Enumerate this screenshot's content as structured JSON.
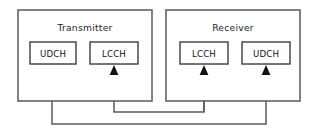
{
  "diagram": {
    "title_visible": false,
    "canvas": {
      "width": 316,
      "height": 133,
      "background": "#ffffff"
    },
    "colors": {
      "outer_border": "#636363",
      "inner_border": "#3d3d3d",
      "connector": "#5a5a5a",
      "arrow_fill": "#111111",
      "text": "#1c1c1c",
      "page_background": "#ffffff"
    },
    "groups": [
      {
        "id": "transmitter",
        "label": "Transmitter",
        "rect": {
          "x": 18,
          "y": 10,
          "width": 134,
          "height": 91
        },
        "label_position": {
          "x": 85,
          "y": 31
        },
        "channels": [
          {
            "id": "tx-udch",
            "label": "UDCH",
            "rect": {
              "x": 30,
              "y": 42,
              "width": 46,
              "height": 22
            },
            "text_position": {
              "x": 53,
              "y": 56
            },
            "role": "source"
          },
          {
            "id": "tx-lcch",
            "label": "LCCH",
            "rect": {
              "x": 90,
              "y": 42,
              "width": 48,
              "height": 22
            },
            "text_position": {
              "x": 114,
              "y": 56
            },
            "role": "destination"
          }
        ]
      },
      {
        "id": "receiver",
        "label": "Receiver",
        "rect": {
          "x": 166,
          "y": 10,
          "width": 134,
          "height": 91
        },
        "label_position": {
          "x": 233,
          "y": 31
        },
        "channels": [
          {
            "id": "rx-lcch",
            "label": "LCCH",
            "rect": {
              "x": 180,
              "y": 42,
              "width": 48,
              "height": 22
            },
            "text_position": {
              "x": 204,
              "y": 56
            },
            "role": "source"
          },
          {
            "id": "rx-udch",
            "label": "UDCH",
            "rect": {
              "x": 242,
              "y": 42,
              "width": 48,
              "height": 22
            },
            "text_position": {
              "x": 266,
              "y": 56
            },
            "role": "destination"
          }
        ]
      }
    ],
    "connections": [
      {
        "id": "udch-link",
        "from": "tx-udch",
        "to": "rx-udch",
        "direction": "transmitter-to-receiver",
        "routing_y": 124,
        "path": "M 52 64 L 52 124 L 266 124 L 266 76",
        "arrow_at": {
          "x": 266,
          "y": 65
        }
      },
      {
        "id": "lcch-link",
        "from": "rx-lcch",
        "to": "tx-lcch",
        "direction": "receiver-to-transmitter",
        "routing_y": 112,
        "path": "M 204 64 L 204 112 L 114 112 L 114 76",
        "arrow_at": {
          "x": 114,
          "y": 65
        }
      },
      {
        "id": "rx-lcch-feed",
        "from": "rx-lcch-internal",
        "to": "rx-lcch",
        "direction": "upward",
        "routing_y": 112,
        "path": "M 204 112 L 204 76",
        "arrow_at": {
          "x": 204,
          "y": 65
        }
      }
    ],
    "arrowheads": [
      {
        "id": "arrow-tx-lcch",
        "x": 114,
        "y": 65,
        "half_width": 4.4,
        "height": 10
      },
      {
        "id": "arrow-rx-lcch",
        "x": 204,
        "y": 65,
        "half_width": 4.4,
        "height": 10
      },
      {
        "id": "arrow-rx-udch",
        "x": 266,
        "y": 65,
        "half_width": 4.4,
        "height": 10
      }
    ]
  }
}
